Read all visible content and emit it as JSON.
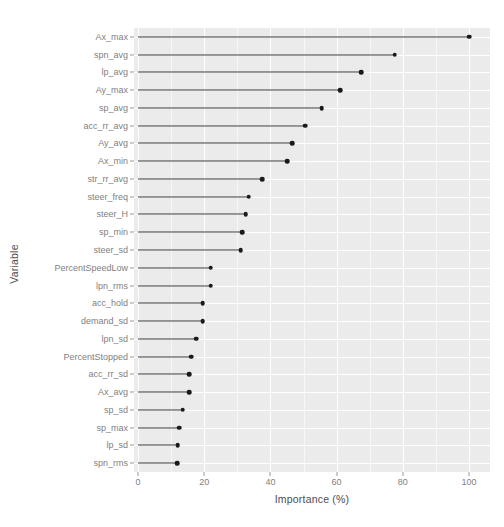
{
  "chart_data": {
    "type": "bar",
    "subtype": "lollipop-horizontal",
    "title": "",
    "xlabel": "Importance (%)",
    "ylabel": "Variable",
    "xlim": [
      0,
      105
    ],
    "ylim": null,
    "grid": true,
    "legend": null,
    "orientation": "horizontal",
    "x_ticks": [
      0,
      20,
      40,
      60,
      80,
      100
    ],
    "x_tick_labels": [
      "0",
      "20",
      "40",
      "60",
      "80",
      "100"
    ],
    "categories": [
      "Ax_max",
      "spn_avg",
      "lp_avg",
      "Ay_max",
      "sp_avg",
      "acc_rr_avg",
      "Ay_avg",
      "Ax_min",
      "str_rr_avg",
      "steer_freq",
      "steer_H",
      "sp_min",
      "steer_sd",
      "PercentSpeedLow",
      "lpn_rms",
      "acc_hold",
      "demand_sd",
      "lpn_sd",
      "PercentStopped",
      "acc_rr_sd",
      "Ax_avg",
      "sp_sd",
      "sp_max",
      "lp_sd",
      "spn_rms"
    ],
    "values": [
      100.0,
      77.5,
      67.5,
      61.0,
      55.5,
      50.5,
      46.5,
      45.0,
      37.5,
      33.5,
      32.5,
      31.5,
      31.0,
      22.0,
      22.0,
      19.5,
      19.5,
      17.5,
      16.0,
      15.5,
      15.5,
      13.5,
      12.5,
      12.0,
      11.8
    ]
  },
  "axis": {
    "x_title": "Importance (%)",
    "y_title": "Variable"
  },
  "style": {
    "panel_background": "#ebebeb",
    "gridline_major": "#ffffff",
    "gridline_minor": "#f7f7f7",
    "point_color": "#1a1a1a",
    "segment_color": "#3a3a3a",
    "tick_label_color": "#7f7f7f",
    "axis_title_color": "#4d4d4d",
    "page_background": "#ffffff"
  }
}
